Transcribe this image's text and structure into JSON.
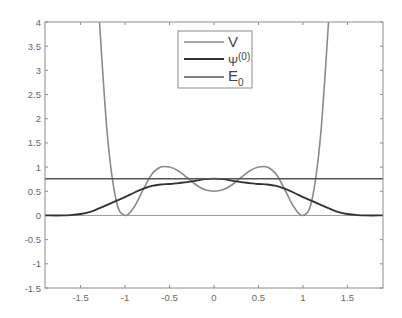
{
  "chart_data": {
    "type": "line",
    "title": "",
    "xlabel": "",
    "ylabel": "",
    "xlim": [
      -1.9,
      1.9
    ],
    "ylim": [
      -1.5,
      4
    ],
    "grid": false,
    "legend_position": "top-center",
    "xticks": [
      -1.5,
      -1,
      -0.5,
      0,
      0.5,
      1,
      1.5
    ],
    "xtick_labels": [
      "-1.5",
      "-1",
      "-0.5",
      "0",
      "0.5",
      "1",
      "1.5"
    ],
    "yticks": [
      -1.5,
      -1,
      -0.5,
      0,
      0.5,
      1,
      1.5,
      2,
      2.5,
      3,
      3.5,
      4
    ],
    "ytick_labels": [
      "-1.5",
      "-1",
      "-0.5",
      "0",
      "0.5",
      "1",
      "1.5",
      "2",
      "2.5",
      "3",
      "3.5",
      "4"
    ],
    "series": [
      {
        "name": "V",
        "label_main": "V",
        "label_sup": "",
        "label_sub": "",
        "color": "#8a8a8a",
        "width": 1.6,
        "x": [
          -1.3,
          -1.2,
          -1.1,
          -1.0,
          -0.9,
          -0.8,
          -0.7,
          -0.6,
          -0.5,
          -0.4,
          -0.3,
          -0.2,
          -0.1,
          0,
          0.1,
          0.2,
          0.3,
          0.4,
          0.5,
          0.6,
          0.7,
          0.8,
          0.9,
          1.0,
          1.1,
          1.2,
          1.3
        ],
        "values": [
          4.35,
          1.69,
          0.31,
          0.0,
          0.17,
          0.52,
          0.85,
          1.0,
          1.0,
          0.92,
          0.78,
          0.63,
          0.53,
          0.5,
          0.53,
          0.63,
          0.78,
          0.92,
          1.0,
          1.0,
          0.85,
          0.52,
          0.17,
          0.0,
          0.31,
          1.69,
          4.35
        ]
      },
      {
        "name": "Psi0",
        "label_main": "Ψ",
        "label_sup": "(0)",
        "label_sub": "",
        "color": "#333333",
        "width": 1.8,
        "x": [
          -1.9,
          -1.7,
          -1.6,
          -1.5,
          -1.4,
          -1.3,
          -1.2,
          -1.1,
          -1.0,
          -0.9,
          -0.8,
          -0.7,
          -0.6,
          -0.5,
          -0.4,
          -0.3,
          -0.2,
          -0.1,
          0,
          0.1,
          0.2,
          0.3,
          0.4,
          0.5,
          0.6,
          0.7,
          0.8,
          0.9,
          1.0,
          1.1,
          1.2,
          1.3,
          1.4,
          1.5,
          1.6,
          1.7,
          1.9
        ],
        "values": [
          0.0,
          0.0,
          0.01,
          0.03,
          0.07,
          0.14,
          0.22,
          0.3,
          0.38,
          0.47,
          0.55,
          0.61,
          0.64,
          0.65,
          0.67,
          0.69,
          0.72,
          0.75,
          0.76,
          0.75,
          0.72,
          0.69,
          0.67,
          0.65,
          0.64,
          0.61,
          0.55,
          0.47,
          0.38,
          0.3,
          0.22,
          0.14,
          0.07,
          0.03,
          0.01,
          0.0,
          0.0
        ]
      },
      {
        "name": "E0",
        "label_main": "E",
        "label_sup": "",
        "label_sub": "0",
        "color": "#555555",
        "width": 1.6,
        "x": [
          -1.9,
          1.9
        ],
        "values": [
          0.76,
          0.76
        ]
      }
    ],
    "reference_lines": [
      {
        "y": 0,
        "color": "#9a9a9a"
      }
    ]
  },
  "legend": {
    "items": [
      {
        "main": "V",
        "sup": "",
        "sub": ""
      },
      {
        "main": "Ψ",
        "sup": "(0)",
        "sub": ""
      },
      {
        "main": "E",
        "sup": "",
        "sub": "0"
      }
    ]
  }
}
